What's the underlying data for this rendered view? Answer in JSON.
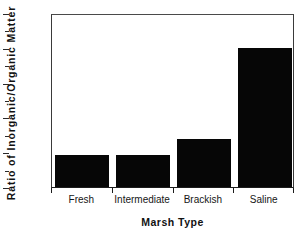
{
  "chart_data": {
    "type": "bar",
    "title": "",
    "xlabel": "Marsh Type",
    "ylabel": "Ratio  of  Inorganic/Organic  Matter",
    "categories": [
      "Fresh",
      "Intermediate",
      "Brackish",
      "Saline"
    ],
    "values": [
      0.92,
      0.92,
      1.38,
      4.0
    ],
    "ylim": [
      0,
      5
    ],
    "xlim_note": "categorical, 4 bars",
    "ytick_labels": [
      "0",
      "1",
      "2",
      "3",
      "4",
      "5"
    ],
    "ytick_values": [
      0,
      1,
      2,
      3,
      4,
      5
    ],
    "yminor_values": [
      0.5,
      1.5,
      2.5,
      3.5,
      4.5
    ],
    "grid": false,
    "legend": "none",
    "bar_color": "#060606",
    "axis_color": "#1c1c1c",
    "background": "#ffffff"
  }
}
